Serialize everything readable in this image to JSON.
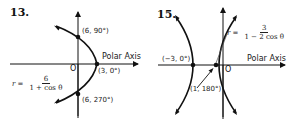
{
  "figures": [
    {
      "number": "13.",
      "axis_label": "Polar Axis",
      "origin_label": "O",
      "equation": {
        "lhs": "r =",
        "numerator": "6",
        "denominator": "1 + cos θ"
      },
      "points": [
        {
          "label": "(6, 90°)"
        },
        {
          "label": "(3, 0°)"
        },
        {
          "label": "(6, 270°)"
        }
      ],
      "curve": "parabola"
    },
    {
      "number": "15.",
      "axis_label": "Polar Axis",
      "origin_label": "O",
      "equation": {
        "lhs": "r =",
        "numerator": "3",
        "denominator": "1 − 2 cos θ"
      },
      "points": [
        {
          "label": "(−3, 0°)"
        },
        {
          "label": "(1, 180°)"
        }
      ],
      "curve": "hyperbola"
    }
  ],
  "colors": {
    "ink": "#111111",
    "background": "#ffffff"
  }
}
